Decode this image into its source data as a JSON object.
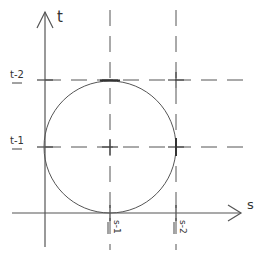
{
  "diagram": {
    "axes": {
      "vertical_label": "t",
      "horizontal_label": "s"
    },
    "ticks": {
      "t_upper": "t-2",
      "t_lower": "t-1",
      "s_left": "s-1",
      "s_right": "s-2"
    },
    "geometry": {
      "origin_x": 45,
      "origin_y": 213,
      "s1_x": 110,
      "s2_x": 176,
      "t1_y": 147,
      "t2_y": 80,
      "circle_cx": 110,
      "circle_cy": 147,
      "circle_r": 66
    },
    "colors": {
      "stroke": "#555555",
      "text": "#333333"
    }
  }
}
